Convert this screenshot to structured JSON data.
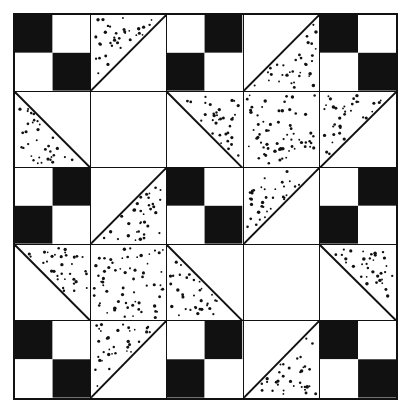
{
  "figure": {
    "width": 412,
    "height": 414
  },
  "palette": {
    "background": "#ffffff",
    "ink": "#111111",
    "fabric_dark": "#111111",
    "fabric_light": "#ffffff",
    "fabric_stipple_ground": "#ffffff",
    "fabric_stipple_dot": "#111111"
  },
  "grid": {
    "rows": 5,
    "columns": 5,
    "border_px": 2,
    "line_px": 1.6,
    "cell_types": [
      "checker",
      "triangle",
      "plain",
      "stipple-full"
    ],
    "triangle_corners": [
      "upper-left",
      "upper-right",
      "lower-left",
      "lower-right"
    ],
    "checker_starts": [
      "dark",
      "light"
    ]
  },
  "cells": [
    {
      "row": 1,
      "col": 1,
      "name": "checker-dark",
      "type": "checker",
      "start": "dark"
    },
    {
      "row": 1,
      "col": 2,
      "name": "triangle-stipple-upper-left",
      "type": "triangle",
      "corner": "upper-left"
    },
    {
      "row": 1,
      "col": 3,
      "name": "checker-light",
      "type": "checker",
      "start": "light"
    },
    {
      "row": 1,
      "col": 4,
      "name": "triangle-stipple-lower-right",
      "type": "triangle",
      "corner": "lower-right"
    },
    {
      "row": 1,
      "col": 5,
      "name": "checker-dark",
      "type": "checker",
      "start": "dark"
    },
    {
      "row": 2,
      "col": 1,
      "name": "triangle-stipple-lower-left",
      "type": "triangle",
      "corner": "lower-left"
    },
    {
      "row": 2,
      "col": 2,
      "name": "plain-white",
      "type": "plain"
    },
    {
      "row": 2,
      "col": 3,
      "name": "triangle-stipple-upper-right",
      "type": "triangle",
      "corner": "upper-right"
    },
    {
      "row": 2,
      "col": 4,
      "name": "stipple-square",
      "type": "stipple-full"
    },
    {
      "row": 2,
      "col": 5,
      "name": "triangle-stipple-upper-left",
      "type": "triangle",
      "corner": "upper-left"
    },
    {
      "row": 3,
      "col": 1,
      "name": "checker-light",
      "type": "checker",
      "start": "light"
    },
    {
      "row": 3,
      "col": 2,
      "name": "triangle-stipple-lower-right",
      "type": "triangle",
      "corner": "lower-right"
    },
    {
      "row": 3,
      "col": 3,
      "name": "checker-dark",
      "type": "checker",
      "start": "dark"
    },
    {
      "row": 3,
      "col": 4,
      "name": "triangle-stipple-upper-left",
      "type": "triangle",
      "corner": "upper-left"
    },
    {
      "row": 3,
      "col": 5,
      "name": "checker-light",
      "type": "checker",
      "start": "light"
    },
    {
      "row": 4,
      "col": 1,
      "name": "triangle-stipple-upper-right",
      "type": "triangle",
      "corner": "upper-right"
    },
    {
      "row": 4,
      "col": 2,
      "name": "stipple-square",
      "type": "stipple-full"
    },
    {
      "row": 4,
      "col": 3,
      "name": "triangle-stipple-lower-left",
      "type": "triangle",
      "corner": "lower-left"
    },
    {
      "row": 4,
      "col": 4,
      "name": "plain-white",
      "type": "plain"
    },
    {
      "row": 4,
      "col": 5,
      "name": "triangle-stipple-upper-right",
      "type": "triangle",
      "corner": "upper-right"
    },
    {
      "row": 5,
      "col": 1,
      "name": "checker-dark",
      "type": "checker",
      "start": "dark"
    },
    {
      "row": 5,
      "col": 2,
      "name": "triangle-stipple-upper-left",
      "type": "triangle",
      "corner": "upper-left"
    },
    {
      "row": 5,
      "col": 3,
      "name": "checker-light",
      "type": "checker",
      "start": "light"
    },
    {
      "row": 5,
      "col": 4,
      "name": "triangle-stipple-lower-right",
      "type": "triangle",
      "corner": "lower-right"
    },
    {
      "row": 5,
      "col": 5,
      "name": "checker-dark",
      "type": "checker",
      "start": "dark"
    }
  ]
}
